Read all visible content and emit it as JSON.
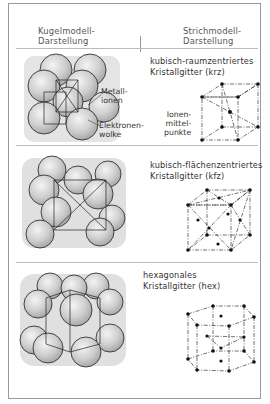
{
  "header": {
    "left": [
      "Kugelmodell-",
      "Darstellung"
    ],
    "right": [
      "Strichmodell-",
      "Darstellung"
    ]
  },
  "sections": [
    {
      "title": [
        "kubisch-raumzentriertes",
        "Kristallgitter (krz)"
      ],
      "labels": {
        "metal_ions": [
          "Metall-",
          "ionen"
        ],
        "electron_cloud": [
          "Elektronen-",
          "wolke"
        ],
        "ion_centers": [
          "Ionen-",
          "mittel-",
          "punkte"
        ]
      }
    },
    {
      "title": [
        "kubisch-flächenzentriertes",
        "Kristallgitter (kfz)"
      ]
    },
    {
      "title": [
        "hexagonales",
        "Kristallgitter (hex)"
      ]
    }
  ]
}
